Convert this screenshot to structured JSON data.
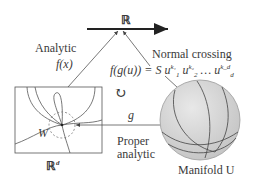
{
  "diagram": {
    "target_space": "ℝ",
    "domain_space": "ℝ",
    "domain_space_superscript": "d",
    "neighborhood_label": "W",
    "manifold_label": "Manifold U",
    "map_f": {
      "label_line1": "Analytic",
      "label_line2": "f(x)"
    },
    "normal_crossing": {
      "title": "Normal crossing",
      "formula_lhs": "f(g(u)) = S",
      "u": "u",
      "terms": [
        {
          "sub": "1",
          "sup": "k₁"
        },
        {
          "sub": "2",
          "sup": "k₂"
        },
        {
          "sub": "d",
          "sup": "k_d"
        }
      ],
      "ellipsis": "…"
    },
    "map_g": {
      "label": "g",
      "desc_line1": "Proper",
      "desc_line2": "analytic"
    },
    "commute_symbol": "↻",
    "colors": {
      "line": "#333333",
      "sphere_fill": "#d6d6d6",
      "sphere_edge": "#9a9a9a",
      "dashed": "#777777"
    }
  }
}
